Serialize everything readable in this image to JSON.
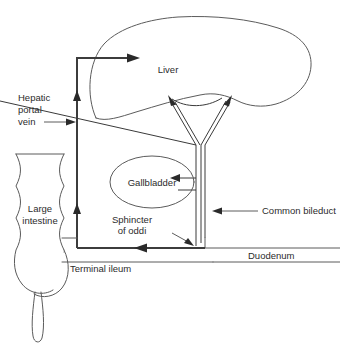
{
  "diagram": {
    "background_color": "#ffffff",
    "line_color": "#4a4a4a",
    "text_color": "#2b2b2b",
    "labels": {
      "liver": "Liver",
      "gallbladder": "Gallbladder",
      "hepatic_portal_vein_line1": "Hepatic",
      "hepatic_portal_vein_line2": "portal",
      "hepatic_portal_vein_line3": "vein",
      "large_intestine_line1": "Large",
      "large_intestine_line2": "intestine",
      "sphincter_of_oddi_line1": "Sphincter",
      "sphincter_of_oddi_line2": "of oddi",
      "common_bileduct": "Common bileduct",
      "terminal_ileum": "Terminal ileum",
      "duodenum": "Duodenum"
    },
    "structures": [
      {
        "name": "liver",
        "label": "Liver",
        "kind": "organ"
      },
      {
        "name": "gallbladder",
        "label": "Gallbladder",
        "kind": "organ"
      },
      {
        "name": "large-intestine",
        "label": "Large intestine",
        "kind": "organ"
      },
      {
        "name": "duodenum",
        "label": "Duodenum",
        "kind": "organ"
      },
      {
        "name": "terminal-ileum",
        "label": "Terminal ileum",
        "kind": "organ"
      },
      {
        "name": "common-bileduct",
        "label": "Common bileduct",
        "kind": "duct"
      },
      {
        "name": "sphincter-of-oddi",
        "label": "Sphincter of oddi",
        "kind": "valve"
      },
      {
        "name": "hepatic-portal-vein",
        "label": "Hepatic portal vein",
        "kind": "vessel"
      }
    ]
  }
}
